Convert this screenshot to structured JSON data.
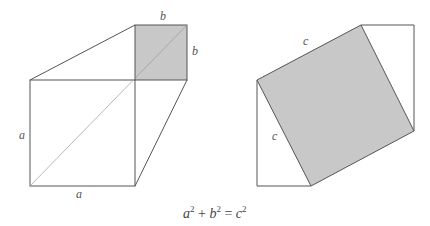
{
  "figure": {
    "left": {
      "label_a_side": "a",
      "label_a_bottom": "a",
      "label_b_top": "b",
      "label_b_right": "b",
      "shade_color": "#c8c8c8"
    },
    "right": {
      "label_c_top": "c",
      "label_c_left": "c",
      "shade_color": "#c8c8c8"
    },
    "formula": {
      "a": "a",
      "a_exp": "2",
      "plus": " + ",
      "b": "b",
      "b_exp": "2",
      "equals": " = ",
      "c": "c",
      "c_exp": "2"
    }
  }
}
